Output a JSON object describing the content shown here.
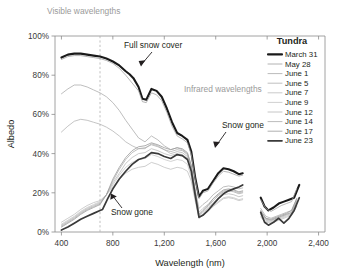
{
  "chart_data": {
    "type": "line",
    "title": "",
    "xlabel": "Wavelength (nm)",
    "ylabel": "Albedo",
    "xlim": [
      350,
      2450
    ],
    "ylim": [
      0,
      100
    ],
    "grid": false,
    "legend_position": "right",
    "legend_title": "Tundra",
    "xticks": [
      400,
      800,
      1200,
      1600,
      2000,
      2400
    ],
    "xtick_labels": [
      "400",
      "800",
      "1,200",
      "1,600",
      "2,000",
      "2,400"
    ],
    "yticks": [
      0,
      20,
      40,
      60,
      80,
      100
    ],
    "ytick_labels": [
      "0%",
      "20%",
      "40%",
      "60%",
      "80%",
      "100%"
    ],
    "annotations": [
      {
        "name": "visible-wavelengths",
        "text": "Visible wavelengths",
        "color": "#9a9a9a"
      },
      {
        "name": "infrared-wavelengths",
        "text": "Infrared wavelengths",
        "color": "#9a9a9a"
      },
      {
        "name": "full-snow-cover",
        "text": "Full snow cover",
        "color": "#231f20"
      },
      {
        "name": "snow-gone-upper",
        "text": "Snow gone",
        "color": "#231f20"
      },
      {
        "name": "snow-gone-lower",
        "text": "Snow gone",
        "color": "#231f20"
      }
    ],
    "visible_ir_divider_nm": 700,
    "series": [
      {
        "name": "March 31",
        "color": "#1a1a1a",
        "width": 2.1,
        "x": [
          400,
          450,
          500,
          550,
          600,
          650,
          700,
          750,
          800,
          850,
          900,
          930,
          960,
          1000,
          1030,
          1060,
          1100,
          1140,
          1180,
          1220,
          1260,
          1300,
          1340,
          1380,
          1410,
          1440,
          1470,
          1500,
          1540,
          1580,
          1620,
          1660,
          1700,
          1740,
          1780,
          1810,
          1950,
          1980,
          2010,
          2050,
          2090,
          2130,
          2170,
          2210,
          2250
        ],
        "values": [
          89,
          90.5,
          91,
          91,
          90.5,
          90,
          89.5,
          88.5,
          87,
          85,
          82,
          80.5,
          78.5,
          74,
          68,
          67.5,
          73,
          72,
          69,
          63,
          56,
          50.5,
          49,
          47,
          41,
          28,
          18,
          21,
          22,
          26,
          30,
          32.5,
          32,
          31,
          29.5,
          30,
          17.5,
          13,
          11,
          12.5,
          14.5,
          15.5,
          16.5,
          17.5,
          24
        ]
      },
      {
        "name": "May 28",
        "color": "#9e9e9e",
        "width": 0.75,
        "x": [
          400,
          450,
          500,
          550,
          600,
          650,
          700,
          750,
          800,
          850,
          900,
          950,
          1000,
          1030,
          1060,
          1100,
          1140,
          1180,
          1220,
          1260,
          1300,
          1340,
          1380,
          1410,
          1440,
          1470,
          1500,
          1540,
          1580,
          1620,
          1660,
          1700,
          1740,
          1780,
          1810,
          1950,
          1990,
          2030,
          2070,
          2110,
          2150,
          2190,
          2230
        ],
        "values": [
          88,
          89.5,
          90,
          90,
          89.5,
          89,
          88.5,
          87.5,
          86,
          83.5,
          80,
          76,
          72,
          66.5,
          66,
          71,
          70,
          67,
          61,
          54,
          49,
          47.5,
          45.5,
          39.5,
          27,
          17,
          20,
          21,
          25,
          28.5,
          31,
          30.5,
          29.5,
          28.5,
          29,
          16.5,
          12,
          10.5,
          12,
          13.5,
          14.5,
          15.5,
          22
        ]
      },
      {
        "name": "June 1",
        "color": "#a8a8a8",
        "width": 0.75,
        "x": [
          400,
          450,
          500,
          550,
          600,
          650,
          700,
          750,
          800,
          850,
          900,
          950,
          1000,
          1050,
          1100,
          1150,
          1200,
          1250,
          1300,
          1340,
          1380,
          1410,
          1440,
          1470,
          1500,
          1540,
          1580,
          1620,
          1660,
          1700,
          1740,
          1780,
          1810,
          1950,
          1990,
          2030,
          2070,
          2110,
          2150,
          2190,
          2230
        ],
        "values": [
          70.5,
          73,
          75,
          75,
          74,
          72.5,
          71,
          69,
          66,
          62,
          57,
          52.5,
          48,
          46,
          49,
          47,
          44,
          42,
          43,
          42,
          40,
          34,
          22,
          12,
          14,
          16,
          19,
          21,
          23,
          23.5,
          23,
          22,
          22.5,
          12,
          8,
          7,
          8,
          9,
          10,
          11,
          17
        ]
      },
      {
        "name": "June 5",
        "color": "#b0b0b0",
        "width": 0.75,
        "x": [
          400,
          450,
          500,
          550,
          600,
          650,
          700,
          750,
          800,
          850,
          900,
          950,
          1000,
          1050,
          1100,
          1150,
          1200,
          1250,
          1300,
          1340,
          1380,
          1410,
          1440,
          1470,
          1500,
          1540,
          1580,
          1620,
          1660,
          1700,
          1740,
          1780,
          1810,
          1950,
          1990,
          2030,
          2070,
          2110,
          2150,
          2190,
          2230
        ],
        "values": [
          51,
          54,
          56.5,
          57.5,
          57,
          56,
          55,
          53.5,
          51.5,
          49,
          46,
          44,
          42.5,
          42.5,
          45,
          44,
          42,
          40,
          41,
          40.5,
          38.5,
          32,
          20,
          10,
          12,
          14,
          17,
          19,
          21,
          21.5,
          21,
          20,
          20.5,
          10.5,
          7,
          6,
          7,
          8,
          9,
          10,
          15.5
        ]
      },
      {
        "name": "June 7",
        "color": "#bdbdbd",
        "width": 0.75,
        "x": [
          400,
          450,
          500,
          550,
          600,
          650,
          700,
          750,
          800,
          850,
          900,
          950,
          1000,
          1050,
          1100,
          1150,
          1200,
          1250,
          1300,
          1340,
          1380,
          1410,
          1440,
          1470,
          1500,
          1540,
          1580,
          1620,
          1660,
          1700,
          1740,
          1780,
          1810,
          1950,
          1990,
          2030,
          2070,
          2110,
          2150,
          2190,
          2230
        ],
        "values": [
          5,
          7,
          9,
          11.5,
          13.5,
          15,
          16,
          19,
          23,
          27,
          30,
          32,
          33,
          33.5,
          35.5,
          34.5,
          33,
          32,
          33,
          32.5,
          31,
          26,
          16,
          7,
          8.5,
          10.5,
          13,
          15,
          17,
          17.5,
          17,
          16,
          16.5,
          7.5,
          5,
          4.5,
          5.5,
          6.5,
          7.5,
          8.5,
          13
        ]
      },
      {
        "name": "June 9",
        "color": "#c4c4c4",
        "width": 0.75,
        "x": [
          400,
          450,
          500,
          550,
          600,
          650,
          700,
          750,
          800,
          850,
          900,
          950,
          1000,
          1050,
          1100,
          1150,
          1200,
          1250,
          1300,
          1340,
          1380,
          1410,
          1440,
          1470,
          1500,
          1540,
          1580,
          1620,
          1660,
          1700,
          1740,
          1780,
          1810,
          1950,
          1990,
          2030,
          2070,
          2110,
          2150,
          2190,
          2230
        ],
        "values": [
          4,
          6,
          8,
          10.5,
          12.5,
          14,
          15.5,
          19,
          24,
          29,
          33,
          35.5,
          37,
          37.5,
          39.5,
          38.5,
          37,
          36,
          37,
          36.5,
          34.5,
          28,
          17,
          7.5,
          9,
          11,
          13.5,
          15.5,
          17.5,
          18,
          17.5,
          16.5,
          17,
          8,
          5.5,
          5,
          6,
          7,
          8,
          9,
          13.5
        ]
      },
      {
        "name": "June 12",
        "color": "#b8b8b8",
        "width": 0.75,
        "x": [
          400,
          450,
          500,
          550,
          600,
          650,
          700,
          750,
          800,
          850,
          900,
          950,
          1000,
          1050,
          1100,
          1150,
          1200,
          1250,
          1300,
          1340,
          1380,
          1410,
          1440,
          1470,
          1500,
          1540,
          1580,
          1620,
          1660,
          1700,
          1740,
          1780,
          1810,
          1950,
          1990,
          2030,
          2070,
          2110,
          2150,
          2190,
          2230
        ],
        "values": [
          3.5,
          5.5,
          7.5,
          10,
          12,
          13.5,
          15,
          19,
          25,
          30,
          35,
          38,
          40,
          40.5,
          42.5,
          41.5,
          40,
          39,
          40,
          39.5,
          37.5,
          31,
          19,
          8,
          10,
          12,
          15,
          17,
          19,
          19.5,
          19,
          18,
          18.5,
          9,
          6,
          5.5,
          6.5,
          7.5,
          8.5,
          9.5,
          14.5
        ]
      },
      {
        "name": "June 14",
        "color": "#aaaaaa",
        "width": 0.75,
        "x": [
          400,
          450,
          500,
          550,
          600,
          650,
          700,
          750,
          800,
          850,
          900,
          950,
          1000,
          1050,
          1100,
          1150,
          1200,
          1250,
          1300,
          1340,
          1380,
          1410,
          1440,
          1470,
          1500,
          1540,
          1580,
          1620,
          1660,
          1700,
          1740,
          1780,
          1810,
          1950,
          1990,
          2030,
          2070,
          2110,
          2150,
          2190,
          2230
        ],
        "values": [
          3,
          5,
          7,
          9.5,
          11.5,
          13,
          14.5,
          19,
          26,
          32,
          37,
          40.5,
          42.5,
          43,
          44.5,
          43.5,
          42,
          41,
          42,
          41.5,
          39.5,
          33,
          20,
          8.5,
          10.5,
          13,
          16,
          18.5,
          20.5,
          21,
          20.5,
          19.5,
          20,
          10,
          6.5,
          6,
          7,
          8,
          9,
          10,
          16
        ]
      },
      {
        "name": "June 17",
        "color": "#9a9a9a",
        "width": 0.8,
        "x": [
          400,
          450,
          500,
          550,
          600,
          650,
          700,
          750,
          800,
          850,
          900,
          950,
          1000,
          1050,
          1100,
          1150,
          1200,
          1250,
          1300,
          1340,
          1380,
          1410,
          1440,
          1470,
          1500,
          1540,
          1580,
          1620,
          1660,
          1700,
          1740,
          1780,
          1810,
          1950,
          1990,
          2030,
          2070,
          2110,
          2150,
          2190,
          2230
        ],
        "values": [
          2.5,
          4.5,
          6.5,
          9,
          11,
          12.5,
          14,
          19,
          27,
          33,
          38,
          41.5,
          43.5,
          44,
          45.5,
          44.5,
          43,
          42,
          43,
          42.5,
          40.5,
          34,
          21,
          9,
          11,
          13.5,
          17,
          19.5,
          21.5,
          22,
          21.5,
          20.5,
          21,
          11,
          7,
          6.5,
          7.5,
          8.5,
          9.5,
          11,
          17
        ]
      },
      {
        "name": "June 23",
        "color": "#3a3a3a",
        "width": 1.7,
        "x": [
          400,
          450,
          500,
          550,
          600,
          650,
          700,
          720,
          760,
          800,
          850,
          900,
          950,
          1000,
          1050,
          1100,
          1150,
          1200,
          1250,
          1300,
          1340,
          1380,
          1410,
          1440,
          1470,
          1500,
          1540,
          1580,
          1620,
          1660,
          1700,
          1740,
          1780,
          1810,
          1950,
          1980,
          2010,
          2050,
          2090,
          2130,
          2170,
          2210,
          2250
        ],
        "values": [
          1,
          2.5,
          4.5,
          6.5,
          8,
          9.5,
          11,
          11.5,
          17,
          22,
          27,
          31,
          34.5,
          37,
          38,
          40.5,
          40,
          38.5,
          37.5,
          39.5,
          39,
          37,
          31,
          19,
          7.5,
          8.5,
          11,
          14,
          17,
          19.5,
          21,
          22,
          23,
          24,
          10,
          5,
          3.5,
          5,
          7,
          4.5,
          7,
          11,
          17.5
        ]
      }
    ]
  },
  "legend": {
    "title": "Tundra",
    "items": [
      {
        "label": "March 31",
        "color": "#1a1a1a",
        "width": 2.1
      },
      {
        "label": "May 28",
        "color": "#9e9e9e",
        "width": 0.8
      },
      {
        "label": "June 1",
        "color": "#a8a8a8",
        "width": 0.8
      },
      {
        "label": "June 5",
        "color": "#b0b0b0",
        "width": 0.8
      },
      {
        "label": "June 7",
        "color": "#bdbdbd",
        "width": 0.8
      },
      {
        "label": "June 9",
        "color": "#c4c4c4",
        "width": 0.8
      },
      {
        "label": "June 12",
        "color": "#b8b8b8",
        "width": 0.8
      },
      {
        "label": "June 14",
        "color": "#aaaaaa",
        "width": 0.8
      },
      {
        "label": "June 17",
        "color": "#9a9a9a",
        "width": 0.8
      },
      {
        "label": "June 23",
        "color": "#3a3a3a",
        "width": 1.7
      }
    ]
  },
  "labels": {
    "visible": "Visible wavelengths",
    "infrared": "Infrared wavelengths",
    "full_snow_cover": "Full snow cover",
    "snow_gone_upper": "Snow gone",
    "snow_gone_lower": "Snow gone",
    "x_title": "Wavelength (nm)",
    "y_title": "Albedo"
  }
}
